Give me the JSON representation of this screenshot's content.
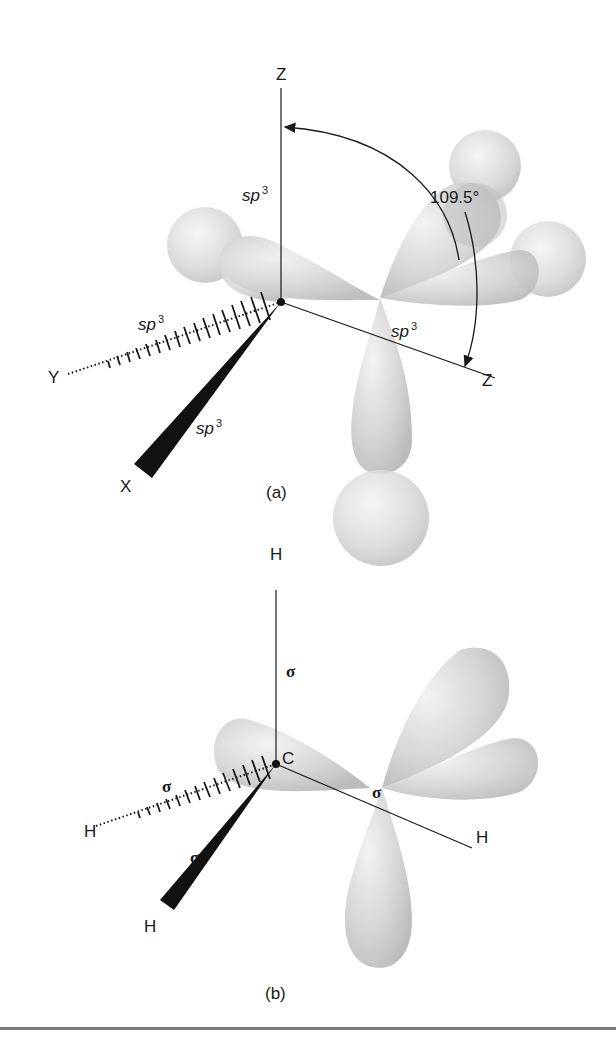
{
  "figure": {
    "panels": [
      {
        "id": "a",
        "caption": "(a)",
        "axes": {
          "z_top": "Z",
          "z_right": "Z",
          "y": "Y",
          "x": "X"
        },
        "orbital_labels": {
          "top": "sp",
          "left": "sp",
          "wedge": "sp",
          "right": "sp",
          "superscript": "3"
        },
        "angle_label": "109.5°"
      },
      {
        "id": "b",
        "caption": "(b)",
        "atoms": {
          "center": "C",
          "top": "H",
          "left": "H",
          "bottom_left": "H",
          "right": "H"
        },
        "bond_labels": {
          "top": "σ",
          "left": "σ",
          "wedge": "σ",
          "right": "σ"
        }
      }
    ]
  }
}
